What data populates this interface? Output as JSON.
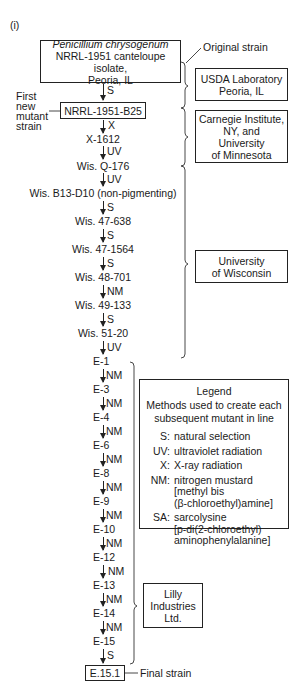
{
  "panel_label": "(i)",
  "origin": {
    "species": "Penicillium chrysogenum",
    "line2": "NRRL-1951 canteloupe isolate,",
    "line3": "Peoria, IL",
    "annotation": "Original strain"
  },
  "first_mutant": {
    "name": "NRRL-1951-B25",
    "annotation_lines": [
      "First",
      "new",
      "mutant",
      "strain"
    ]
  },
  "lineage": [
    {
      "method": "S",
      "strain": "NRRL-1951-B25"
    },
    {
      "method": "X",
      "strain": "X-1612"
    },
    {
      "method": "UV",
      "strain": "Wis. Q-176"
    },
    {
      "method": "UV",
      "strain": "Wis. B13-D10 (non-pigmenting)"
    },
    {
      "method": "S",
      "strain": "Wis. 47-638"
    },
    {
      "method": "S",
      "strain": "Wis. 47-1564"
    },
    {
      "method": "S",
      "strain": "Wis. 48-701"
    },
    {
      "method": "NM",
      "strain": "Wis. 49-133"
    },
    {
      "method": "S",
      "strain": "Wis. 51-20"
    },
    {
      "method": "UV",
      "strain": "E-1"
    },
    {
      "method": "NM",
      "strain": "E-3"
    },
    {
      "method": "NM",
      "strain": "E-4"
    },
    {
      "method": "NM",
      "strain": "E-6"
    },
    {
      "method": "NM",
      "strain": "E-8"
    },
    {
      "method": "NM",
      "strain": "E-9"
    },
    {
      "method": "NM",
      "strain": "E-10"
    },
    {
      "method": "NM",
      "strain": "E-12"
    },
    {
      "method": "NM",
      "strain": "E-13"
    },
    {
      "method": "NM",
      "strain": "E-14"
    },
    {
      "method": "NM",
      "strain": "E-15"
    },
    {
      "method": "S",
      "strain": "E.15.1"
    }
  ],
  "final": {
    "name": "E.15.1",
    "annotation": "Final strain"
  },
  "institutions": [
    {
      "name_lines": [
        "USDA Laboratory",
        "Peoria, IL"
      ]
    },
    {
      "name_lines": [
        "Carnegie Institute,",
        "NY, and",
        "University",
        "of Minnesota"
      ]
    },
    {
      "name_lines": [
        "University",
        "of Wisconsin"
      ]
    },
    {
      "name_lines": [
        "Lilly",
        "Industries",
        "Ltd."
      ]
    }
  ],
  "legend": {
    "title": "Legend",
    "subtitle_lines": [
      "Methods used to create each",
      "subsequent mutant in line"
    ],
    "entries": [
      {
        "key": "S:",
        "lines": [
          "natural selection"
        ]
      },
      {
        "key": "UV:",
        "lines": [
          "ultraviolet radiation"
        ]
      },
      {
        "key": "X:",
        "lines": [
          "X-ray radiation"
        ]
      },
      {
        "key": "NM:",
        "lines": [
          "nitrogen mustard",
          "[methyl bis",
          "(β-chloroethyl)amine]"
        ]
      },
      {
        "key": "SA:",
        "lines": [
          "sarcolysine",
          "[p-di(2-chloroethyl)",
          "aminophenylalanine]"
        ]
      }
    ]
  }
}
